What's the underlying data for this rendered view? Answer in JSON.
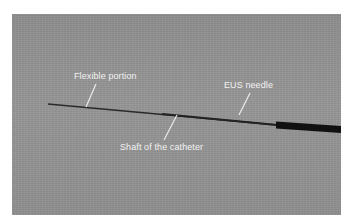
{
  "figure": {
    "labels": {
      "flexible_portion": "Flexible portion",
      "eus_needle": "EUS needle",
      "shaft": "Shaft of the catheter"
    },
    "colors": {
      "background": "#939393",
      "catheter": "#1a1a1a",
      "label_text": "#f2f2f2"
    }
  }
}
